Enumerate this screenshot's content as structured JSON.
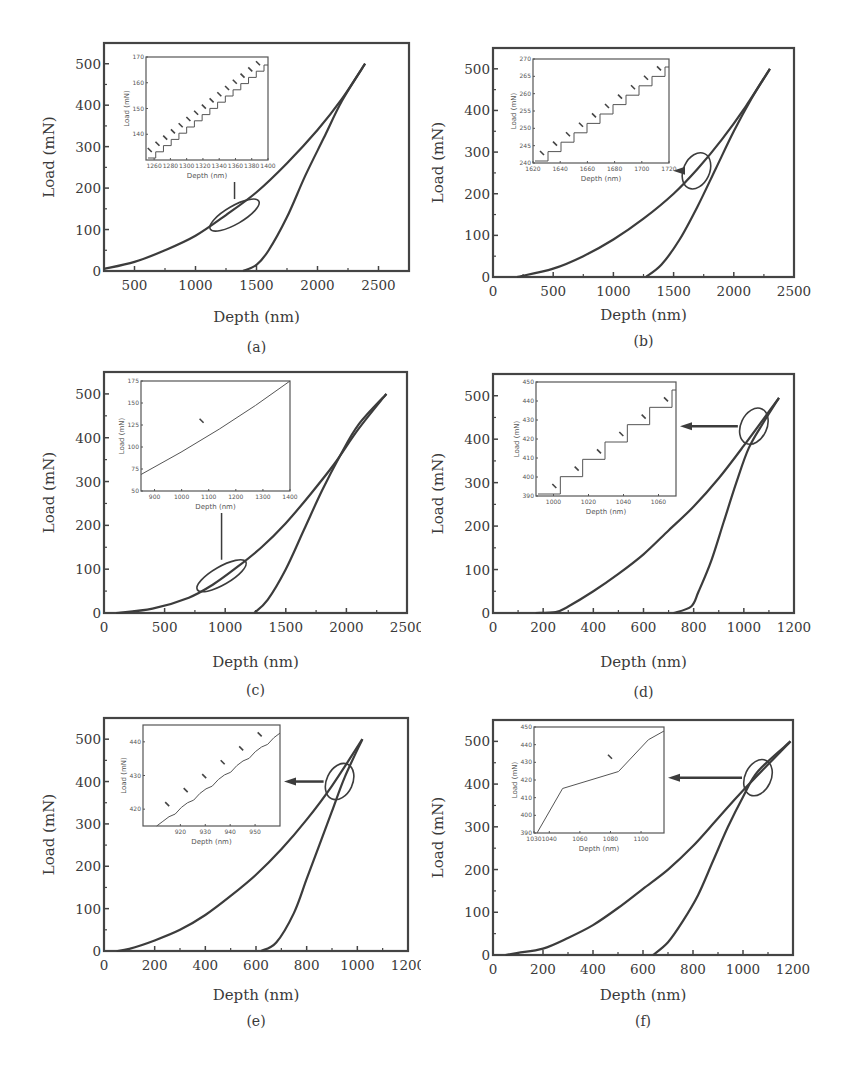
{
  "figure": {
    "panels_count": 6,
    "line_color": "#3c3c3c",
    "frame_color": "#444444"
  },
  "chart_data": [
    {
      "id": "a",
      "type": "line",
      "caption": "(a)",
      "xlabel": "Depth (nm)",
      "ylabel": "Load (mN)",
      "xlim": [
        250,
        2750
      ],
      "ylim": [
        0,
        550
      ],
      "xticks": [
        500,
        1000,
        1500,
        2000,
        2500
      ],
      "yticks": [
        0,
        100,
        200,
        300,
        400,
        500
      ],
      "series": [
        {
          "name": "loading",
          "x": [
            250,
            500,
            750,
            1000,
            1250,
            1500,
            1750,
            2000,
            2200,
            2390
          ],
          "y": [
            5,
            22,
            50,
            85,
            135,
            190,
            260,
            340,
            415,
            500
          ]
        },
        {
          "name": "unloading",
          "x": [
            1390,
            1500,
            1600,
            1750,
            1900,
            2050,
            2200,
            2390
          ],
          "y": [
            0,
            15,
            50,
            130,
            230,
            320,
            410,
            500
          ]
        }
      ],
      "annotation": {
        "type": "ellipse",
        "center": [
          1320,
          135
        ],
        "arrow": "up-to-inset"
      },
      "inset": {
        "xlabel": "Depth (nm)",
        "ylabel": "Load (mN)",
        "xlim": [
          1250,
          1400
        ],
        "ylim": [
          130,
          170
        ],
        "xticks": [
          1260,
          1280,
          1300,
          1320,
          1340,
          1360,
          1380,
          1400
        ],
        "yticks": [
          140,
          150,
          160,
          170
        ],
        "shape": "staircase",
        "pop_in_arrows": 15
      }
    },
    {
      "id": "b",
      "type": "line",
      "caption": "(b)",
      "xlabel": "Depth (nm)",
      "ylabel": "Load (mN)",
      "xlim": [
        0,
        2500
      ],
      "ylim": [
        0,
        550
      ],
      "xticks": [
        0,
        500,
        1000,
        1500,
        2000,
        2500
      ],
      "yticks": [
        0,
        100,
        200,
        300,
        400,
        500
      ],
      "series": [
        {
          "name": "loading",
          "x": [
            200,
            500,
            750,
            1000,
            1250,
            1500,
            1700,
            1900,
            2100,
            2300
          ],
          "y": [
            0,
            20,
            50,
            90,
            140,
            200,
            260,
            330,
            410,
            500
          ]
        },
        {
          "name": "unloading",
          "x": [
            1270,
            1400,
            1550,
            1700,
            1850,
            2000,
            2150,
            2300
          ],
          "y": [
            0,
            30,
            90,
            170,
            260,
            350,
            430,
            500
          ]
        }
      ],
      "annotation": {
        "type": "ellipse",
        "center": [
          1690,
          255
        ],
        "arrow": "left-to-inset"
      },
      "inset": {
        "xlabel": "Depth (nm)",
        "ylabel": "Load (mN)",
        "xlim": [
          1620,
          1720
        ],
        "ylim": [
          240,
          270
        ],
        "xticks": [
          1620,
          1640,
          1660,
          1680,
          1700,
          1720
        ],
        "yticks": [
          240,
          245,
          250,
          255,
          260,
          265,
          270
        ],
        "shape": "staircase",
        "pop_in_arrows": 10
      }
    },
    {
      "id": "c",
      "type": "line",
      "caption": "(c)",
      "xlabel": "Depth (nm)",
      "ylabel": "Load (mN)",
      "xlim": [
        0,
        2500
      ],
      "ylim": [
        0,
        550
      ],
      "xticks": [
        0,
        500,
        1000,
        1500,
        2000,
        2500
      ],
      "yticks": [
        0,
        100,
        200,
        300,
        400,
        500
      ],
      "series": [
        {
          "name": "loading",
          "x": [
            100,
            400,
            700,
            900,
            1100,
            1300,
            1500,
            1700,
            1900,
            2100,
            2330
          ],
          "y": [
            0,
            10,
            35,
            65,
            105,
            150,
            205,
            270,
            340,
            420,
            500
          ]
        },
        {
          "name": "unloading",
          "x": [
            1240,
            1350,
            1500,
            1650,
            1800,
            1950,
            2100,
            2330
          ],
          "y": [
            0,
            30,
            100,
            190,
            280,
            360,
            430,
            500
          ]
        }
      ],
      "annotation": {
        "type": "ellipse",
        "center": [
          970,
          85
        ],
        "arrow": "up-to-inset"
      },
      "inset": {
        "xlabel": "Depth (nm)",
        "ylabel": "Load (mN)",
        "xlim": [
          850,
          1400
        ],
        "ylim": [
          50,
          175
        ],
        "xticks": [
          900,
          1000,
          1100,
          1200,
          1300,
          1400
        ],
        "yticks": [
          50,
          75,
          100,
          125,
          150,
          175
        ],
        "shape": "smooth",
        "pop_in_arrows": 1
      }
    },
    {
      "id": "d",
      "type": "line",
      "caption": "(d)",
      "xlabel": "Depth (nm)",
      "ylabel": "Load (mN)",
      "xlim": [
        0,
        1200
      ],
      "ylim": [
        0,
        550
      ],
      "xticks": [
        0,
        200,
        400,
        600,
        800,
        1000,
        1200
      ],
      "yticks": [
        0,
        100,
        200,
        300,
        400,
        500
      ],
      "series": [
        {
          "name": "loading",
          "x": [
            170,
            250,
            300,
            400,
            500,
            600,
            700,
            800,
            900,
            1000,
            1140
          ],
          "y": [
            0,
            2,
            15,
            50,
            90,
            135,
            190,
            245,
            310,
            385,
            495
          ]
        },
        {
          "name": "unloading",
          "x": [
            720,
            790,
            820,
            870,
            920,
            970,
            1020,
            1080,
            1140
          ],
          "y": [
            0,
            15,
            50,
            120,
            210,
            300,
            380,
            440,
            495
          ]
        }
      ],
      "annotation": {
        "type": "ellipse",
        "center": [
          1040,
          430
        ],
        "arrow": "left-to-inset"
      },
      "inset": {
        "xlabel": "Depth (nm)",
        "ylabel": "Load (mN)",
        "xlim": [
          990,
          1070
        ],
        "ylim": [
          390,
          450
        ],
        "xticks": [
          1000,
          1020,
          1040,
          1060
        ],
        "yticks": [
          390,
          400,
          410,
          420,
          430,
          440,
          450
        ],
        "shape": "staircase",
        "pop_in_arrows": 6
      }
    },
    {
      "id": "e",
      "type": "line",
      "caption": "(e)",
      "xlabel": "Depth (nm)",
      "ylabel": "Load (mN)",
      "xlim": [
        0,
        1200
      ],
      "ylim": [
        0,
        550
      ],
      "xticks": [
        0,
        200,
        400,
        600,
        800,
        1000,
        1200
      ],
      "yticks": [
        0,
        100,
        200,
        300,
        400,
        500
      ],
      "series": [
        {
          "name": "loading",
          "x": [
            50,
            100,
            200,
            300,
            400,
            500,
            600,
            700,
            800,
            900,
            1020
          ],
          "y": [
            0,
            5,
            25,
            50,
            85,
            130,
            180,
            240,
            310,
            390,
            500
          ]
        },
        {
          "name": "unloading",
          "x": [
            620,
            680,
            750,
            800,
            850,
            900,
            950,
            1020
          ],
          "y": [
            0,
            20,
            90,
            170,
            250,
            330,
            410,
            500
          ]
        }
      ],
      "annotation": {
        "type": "ellipse",
        "center": [
          930,
          400
        ],
        "arrow": "left-to-inset"
      },
      "inset": {
        "xlabel": "Depth (nm)",
        "ylabel": "Load (mN)",
        "xlim": [
          905,
          960
        ],
        "ylim": [
          415,
          445
        ],
        "xticks": [
          920,
          930,
          940,
          950
        ],
        "yticks": [
          420,
          430,
          440
        ],
        "shape": "wavy-linear",
        "pop_in_arrows": 7
      }
    },
    {
      "id": "f",
      "type": "line",
      "caption": "(f)",
      "xlabel": "Depth (nm)",
      "ylabel": "Load (mN)",
      "xlim": [
        0,
        1200
      ],
      "ylim": [
        0,
        550
      ],
      "xticks": [
        0,
        200,
        400,
        600,
        800,
        1000,
        1200
      ],
      "yticks": [
        0,
        100,
        200,
        300,
        400,
        500
      ],
      "series": [
        {
          "name": "loading",
          "x": [
            50,
            100,
            200,
            300,
            400,
            500,
            600,
            700,
            800,
            900,
            1000,
            1190
          ],
          "y": [
            0,
            5,
            15,
            40,
            70,
            110,
            155,
            200,
            255,
            320,
            385,
            500
          ]
        },
        {
          "name": "unloading",
          "x": [
            640,
            700,
            760,
            820,
            880,
            940,
            1000,
            1060,
            1190
          ],
          "y": [
            0,
            30,
            80,
            140,
            220,
            300,
            370,
            430,
            500
          ]
        }
      ],
      "annotation": {
        "type": "ellipse",
        "center": [
          1060,
          415
        ],
        "arrow": "left-to-inset"
      },
      "inset": {
        "xlabel": "Depth (nm)",
        "ylabel": "Load (mN)",
        "xlim": [
          1030,
          1115
        ],
        "ylim": [
          390,
          450
        ],
        "xticks": [
          1030,
          1040,
          1060,
          1080,
          1100
        ],
        "yticks": [
          390,
          400,
          410,
          420,
          430,
          440,
          450
        ],
        "shape": "piecewise-linear",
        "pop_in_arrows": 1
      }
    }
  ]
}
